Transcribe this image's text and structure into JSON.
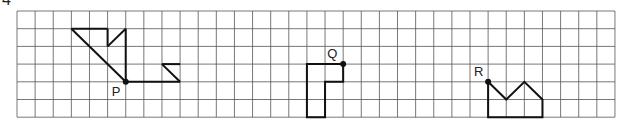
{
  "question_number": "4",
  "grid": {
    "cols": 33,
    "rows": 6
  },
  "points": [
    {
      "label": "P",
      "col": 6,
      "row": 4
    },
    {
      "label": "Q",
      "col": 18,
      "row": 3
    },
    {
      "label": "R",
      "col": 26,
      "row": 4
    }
  ],
  "shapes": {
    "P": [
      [
        3,
        1
      ],
      [
        5,
        1
      ],
      [
        5,
        2
      ],
      [
        6,
        1
      ],
      [
        6,
        4
      ],
      [
        9,
        4
      ],
      [
        8,
        3
      ],
      [
        9,
        3
      ]
    ],
    "Q": [
      [
        18,
        3
      ],
      [
        16,
        3
      ],
      [
        16,
        6
      ],
      [
        17,
        6
      ],
      [
        17,
        4
      ],
      [
        18,
        4
      ]
    ],
    "R": [
      [
        26,
        4
      ],
      [
        27,
        5
      ],
      [
        28,
        4
      ],
      [
        29,
        5
      ],
      [
        29,
        6
      ],
      [
        26,
        6
      ]
    ]
  }
}
